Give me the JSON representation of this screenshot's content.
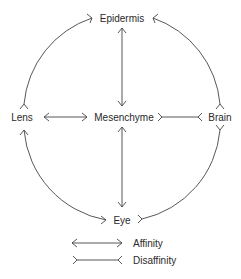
{
  "diagram": {
    "nodes": {
      "epidermis": "Epidermis",
      "lens": "Lens",
      "mesenchyme": "Mesenchyme",
      "brain": "Brain",
      "eye": "Eye"
    },
    "edges": [
      {
        "from": "Epidermis",
        "to": "Mesenchyme",
        "type": "affinity"
      },
      {
        "from": "Lens",
        "to": "Mesenchyme",
        "type": "affinity"
      },
      {
        "from": "Mesenchyme",
        "to": "Eye",
        "type": "affinity"
      },
      {
        "from": "Lens",
        "to": "Eye",
        "type": "affinity"
      },
      {
        "from": "Mesenchyme",
        "to": "Brain",
        "type": "disaffinity"
      },
      {
        "from": "Epidermis",
        "to": "Lens",
        "type": "disaffinity"
      },
      {
        "from": "Epidermis",
        "to": "Brain",
        "type": "disaffinity"
      },
      {
        "from": "Brain",
        "to": "Eye",
        "type": "disaffinity"
      }
    ],
    "legend": {
      "affinity": "Affinity",
      "disaffinity": "Disaffinity"
    },
    "colors": {
      "line": "#444444",
      "text": "#2a2a2a",
      "background": "#ffffff"
    }
  }
}
